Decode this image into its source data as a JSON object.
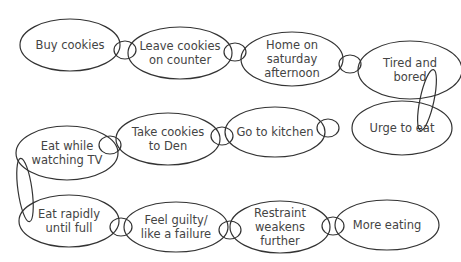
{
  "diagram": {
    "type": "chain-of-events",
    "stroke_color": "#333333",
    "text_color": "#444444",
    "nodes": [
      {
        "id": "n1",
        "lines": [
          "Buy cookies"
        ],
        "cx": 70,
        "cy": 45,
        "rx": 50,
        "ry": 26
      },
      {
        "id": "n2",
        "lines": [
          "Leave cookies",
          "on counter"
        ],
        "cx": 180,
        "cy": 53,
        "rx": 52,
        "ry": 26
      },
      {
        "id": "n3",
        "lines": [
          "Home on",
          "saturday",
          "afternoon"
        ],
        "cx": 292,
        "cy": 59,
        "rx": 51,
        "ry": 27
      },
      {
        "id": "n4",
        "lines": [
          "Tired and",
          "bored"
        ],
        "cx": 410,
        "cy": 70,
        "rx": 52,
        "ry": 29
      },
      {
        "id": "n5",
        "lines": [
          "Urge to eat"
        ],
        "cx": 402,
        "cy": 128,
        "rx": 50,
        "ry": 27
      },
      {
        "id": "n6",
        "lines": [
          "Go to kitchen"
        ],
        "cx": 275,
        "cy": 132,
        "rx": 50,
        "ry": 25
      },
      {
        "id": "n7",
        "lines": [
          "Take cookies",
          "to Den"
        ],
        "cx": 168,
        "cy": 139,
        "rx": 52,
        "ry": 26
      },
      {
        "id": "n8",
        "lines": [
          "Eat while",
          "watching TV"
        ],
        "cx": 67,
        "cy": 153,
        "rx": 51,
        "ry": 27
      },
      {
        "id": "n9",
        "lines": [
          "Eat rapidly",
          "until full"
        ],
        "cx": 69,
        "cy": 221,
        "rx": 50,
        "ry": 26
      },
      {
        "id": "n10",
        "lines": [
          "Feel guilty/",
          "like a failure"
        ],
        "cx": 176,
        "cy": 227,
        "rx": 52,
        "ry": 25
      },
      {
        "id": "n11",
        "lines": [
          "Restraint",
          "weakens",
          "further"
        ],
        "cx": 280,
        "cy": 227,
        "rx": 50,
        "ry": 26
      },
      {
        "id": "n12",
        "lines": [
          "More eating"
        ],
        "cx": 387,
        "cy": 225,
        "rx": 52,
        "ry": 25
      }
    ],
    "links": [
      {
        "cx": 125,
        "cy": 50,
        "rx": 11,
        "ry": 9,
        "rot": 0
      },
      {
        "cx": 235,
        "cy": 52,
        "rx": 11,
        "ry": 9,
        "rot": 0
      },
      {
        "cx": 350,
        "cy": 64,
        "rx": 11,
        "ry": 9,
        "rot": 0
      },
      {
        "cx": 427,
        "cy": 100,
        "rx": 7,
        "ry": 31,
        "rot": 12
      },
      {
        "cx": 328,
        "cy": 128,
        "rx": 11,
        "ry": 9,
        "rot": 0
      },
      {
        "cx": 222,
        "cy": 136,
        "rx": 11,
        "ry": 9,
        "rot": 0
      },
      {
        "cx": 110,
        "cy": 145,
        "rx": 11,
        "ry": 9,
        "rot": 0
      },
      {
        "cx": 25,
        "cy": 190,
        "rx": 7,
        "ry": 32,
        "rot": -8
      },
      {
        "cx": 121,
        "cy": 227,
        "rx": 11,
        "ry": 9,
        "rot": 0
      },
      {
        "cx": 230,
        "cy": 230,
        "rx": 11,
        "ry": 9,
        "rot": 0
      },
      {
        "cx": 333,
        "cy": 226,
        "rx": 11,
        "ry": 9,
        "rot": 0
      }
    ]
  }
}
